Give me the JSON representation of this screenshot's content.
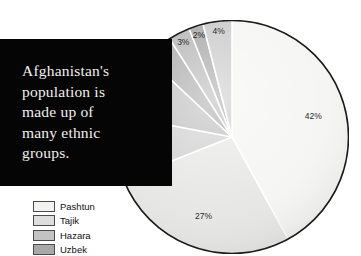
{
  "caption": {
    "text": "Afghanistan's\npopulation is\nmade up  of\nmany ethnic\ngroups."
  },
  "legend": {
    "title": "",
    "items": [
      {
        "label": "Pashtun",
        "color": "#f2f2f0"
      },
      {
        "label": "Tajik",
        "color": "#dedede"
      },
      {
        "label": "Hazara",
        "color": "#c3c3c3"
      },
      {
        "label": "Uzbek",
        "color": "#a8a8a8"
      }
    ]
  },
  "chart_data": {
    "type": "pie",
    "title": "Afghanistan's population is made up of many ethnic groups.",
    "legend_position": "bottom-left",
    "categories": [
      "Pashtun",
      "Tajik",
      "Hazara",
      "Uzbek",
      "Aimak",
      "Turkmen",
      "Baloch",
      "Other"
    ],
    "values": [
      42,
      27,
      9,
      9,
      4,
      3,
      2,
      4
    ],
    "labels": [
      "42%",
      "27%",
      "9%",
      "9%",
      "4%",
      "3%",
      "2%",
      "4%"
    ],
    "colors": [
      "#f4f4f2",
      "#e4e4e2",
      "#c9c9c9",
      "#b4b4b4",
      "#9e9e9e",
      "#acacac",
      "#9a9a9a",
      "#c2c2c2"
    ],
    "start_angle_deg": 0,
    "direction": "clockwise",
    "xlabel": "",
    "ylabel": ""
  }
}
